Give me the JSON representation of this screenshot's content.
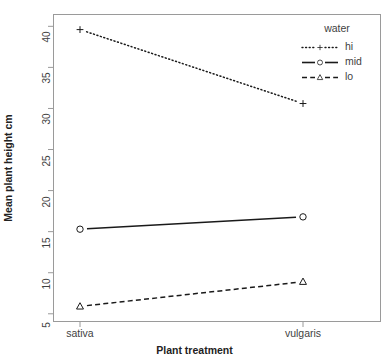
{
  "chart_data": {
    "type": "line",
    "title": "",
    "xlabel": "Plant treatment",
    "ylabel": "Mean plant height cm",
    "categories": [
      "sativa",
      "vulgaris"
    ],
    "x": [
      0,
      1
    ],
    "series": [
      {
        "name": "hi",
        "values": [
          39.6,
          30.6
        ],
        "marker": "plus",
        "linestyle": "dotted"
      },
      {
        "name": "mid",
        "values": [
          15.3,
          16.8
        ],
        "marker": "circle",
        "linestyle": "solid"
      },
      {
        "name": "lo",
        "values": [
          5.9,
          8.9
        ],
        "marker": "triangle",
        "linestyle": "dashed"
      }
    ],
    "legend": {
      "title": "water",
      "position": "top-right",
      "entries": [
        "hi",
        "mid",
        "lo"
      ]
    },
    "ylim": [
      4.0,
      41.5
    ],
    "yticks": [
      5,
      10,
      15,
      20,
      25,
      30,
      35,
      40
    ],
    "ytick_labels": [
      "5",
      "10",
      "15",
      "20",
      "25",
      "30",
      "35",
      "40"
    ],
    "grid": false,
    "colors": {
      "line": "#1a1a1a",
      "frame": "#9a9a9a",
      "text": "#3f3f3f",
      "axis_title": "#222222",
      "background": "#ffffff"
    }
  }
}
